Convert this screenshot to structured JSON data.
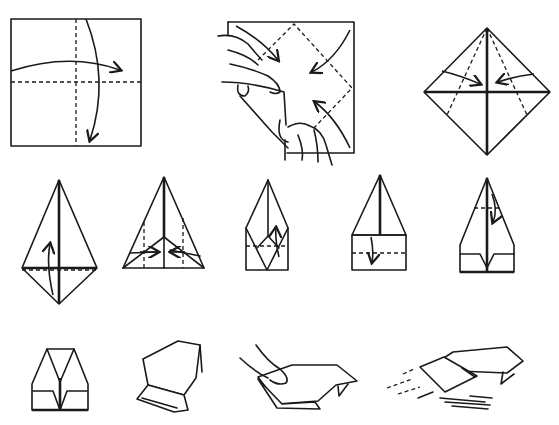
{
  "diagram": {
    "type": "origami-instructions",
    "line_color": "#1a1a1a",
    "background": "#ffffff",
    "steps": [
      {
        "n": 1,
        "description": "Square sheet; fold in half both ways (dashed crease lines, curved arrows)"
      },
      {
        "n": 2,
        "description": "Hands collapsing corners toward center along dashed diagonals"
      },
      {
        "n": 3,
        "description": "Diamond base; fold side edges to center along dashed lines"
      },
      {
        "n": 4,
        "description": "Kite shape; fold bottom point up"
      },
      {
        "n": 5,
        "description": "Triangle with dashed vertical creases; fold flaps inward"
      },
      {
        "n": 6,
        "description": "Fold along dashed line, arrow up"
      },
      {
        "n": 7,
        "description": "Fold bottom edge down along dashed line"
      },
      {
        "n": 8,
        "description": "Fold nose down along dashed line"
      },
      {
        "n": 9,
        "description": "Folded body, front view"
      },
      {
        "n": 10,
        "description": "Folded glider, angled view"
      },
      {
        "n": 11,
        "description": "Hand holding glider ready to launch"
      },
      {
        "n": 12,
        "description": "Glider in flight with motion lines"
      }
    ]
  }
}
